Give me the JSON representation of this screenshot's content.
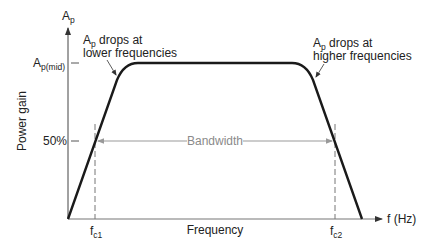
{
  "diagram": {
    "y_axis": {
      "label": "Power gain",
      "symbol_main": "A",
      "symbol_sub": "p",
      "ticks": [
        {
          "main": "A",
          "sub": "p(mid)"
        },
        {
          "main": "50%",
          "sub": ""
        }
      ]
    },
    "x_axis": {
      "label": "Frequency",
      "unit_label": "f (Hz)",
      "ticks": [
        {
          "main": "f",
          "sub": "c1"
        },
        {
          "main": "f",
          "sub": "c2"
        }
      ]
    },
    "annotations": {
      "low": {
        "line1_main": "A",
        "line1_sub": "p",
        "line1_rest": " drops at",
        "line2": "lower frequencies"
      },
      "high": {
        "line1_main": "A",
        "line1_sub": "p",
        "line1_rest": " drops at",
        "line2": "higher frequencies"
      },
      "bandwidth": "Bandwidth"
    },
    "colors": {
      "curve": "#1a1a1a",
      "axis": "#555555",
      "bandwidth": "#999999",
      "dashed": "#777777"
    }
  }
}
